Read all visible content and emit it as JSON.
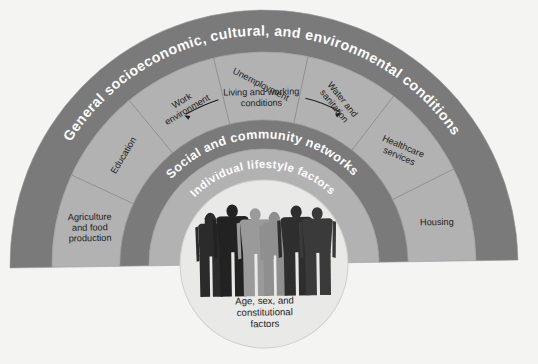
{
  "figure": {
    "background_color": "#f4f4f2",
    "colors": {
      "dark_band": "#7a7a7a",
      "light_band": "#b2b2b2",
      "inner_circle": "#e9e9e7",
      "band_label": "#ffffff",
      "segment_label": "#1c1c1c",
      "divider": "#8c8c8c",
      "figure_silhouette_dark": "#2b2b2b",
      "figure_silhouette_mid": "#5a5a5a",
      "figure_silhouette_light": "#9a9a9a"
    }
  },
  "layers": [
    {
      "id": "outer",
      "name": "general-conditions-band",
      "label": "General socioeconomic, cultural, and environmental conditions",
      "style": "dark",
      "label_color": "#ffffff"
    },
    {
      "id": "living-working",
      "name": "living-and-working-conditions-band",
      "label": "Living and working conditions",
      "style": "light",
      "label_color": "#1c1c1c",
      "has_arrows": true,
      "segments": [
        {
          "label": "Agriculture and food production",
          "lines": [
            "Agriculture",
            "and food",
            "production"
          ]
        },
        {
          "label": "Education",
          "lines": [
            "Education"
          ]
        },
        {
          "label": "Work environment",
          "lines": [
            "Work",
            "environment"
          ]
        },
        {
          "label": "Unemployment",
          "lines": [
            "Unemployment"
          ]
        },
        {
          "label": "Water and sanitation",
          "lines": [
            "Water and",
            "sanitation"
          ]
        },
        {
          "label": "Healthcare services",
          "lines": [
            "Healthcare",
            "services"
          ]
        },
        {
          "label": "Housing",
          "lines": [
            "Housing"
          ]
        }
      ]
    },
    {
      "id": "social",
      "name": "social-and-community-networks-band",
      "label": "Social and community networks",
      "style": "dark",
      "label_color": "#ffffff"
    },
    {
      "id": "lifestyle",
      "name": "individual-lifestyle-factors-band",
      "label": "Individual lifestyle factors",
      "style": "light",
      "label_color": "#ffffff"
    },
    {
      "id": "core",
      "name": "core-circle",
      "label": "Age, sex, and constitutional factors",
      "lines": [
        "Age, sex, and",
        "constitutional",
        "factors"
      ],
      "style": "core",
      "label_color": "#1c1c1c"
    }
  ],
  "core": {
    "lines": [
      "Age, sex, and",
      "constitutional",
      "factors"
    ],
    "people_count": 6,
    "people_icon": "people-silhouette-icon"
  },
  "arrows": {
    "left": "arrow-left-icon",
    "right": "arrow-right-icon"
  }
}
